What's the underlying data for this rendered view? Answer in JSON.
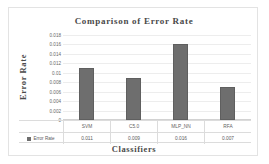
{
  "chart_data": {
    "type": "bar",
    "title": "Comparison of Error Rate",
    "xlabel": "Classifiers",
    "ylabel": "Error Rate",
    "categories": [
      "SVM",
      "C5.0",
      "MLP_NN",
      "RFA"
    ],
    "values": [
      0.011,
      0.009,
      0.016,
      0.007
    ],
    "value_labels": [
      "0.011",
      "0.009",
      "0.016",
      "0.007"
    ],
    "series": [
      {
        "name": "Error Rate",
        "values": [
          0.011,
          0.009,
          0.016,
          0.007
        ]
      }
    ],
    "ylim": [
      0,
      0.018
    ],
    "ytick_labels": [
      "0.018",
      "0.016",
      "0.014",
      "0.012",
      "0.01",
      "0.008",
      "0.006",
      "0.004",
      "0.002",
      "0"
    ],
    "ytick_values": [
      0.018,
      0.016,
      0.014,
      0.012,
      0.01,
      0.008,
      0.006,
      0.004,
      0.002,
      0
    ],
    "grid": true,
    "legend_position": "data-table",
    "legend_entries": [
      "Error Rate"
    ],
    "data_table_visible": true,
    "bar_color": "#6e6e6e",
    "gridline_color": "#ededed",
    "text_color": "#4a4a4a"
  },
  "legend": {
    "series_label": "Error Rate"
  }
}
